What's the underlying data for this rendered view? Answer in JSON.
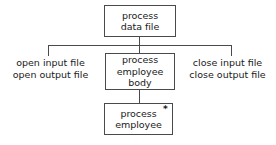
{
  "diagram": {
    "type": "structure-chart",
    "nodes": [
      {
        "id": "process-data-file",
        "lines": [
          "process",
          "data file"
        ],
        "level": 0
      },
      {
        "id": "process-employee-body",
        "lines": [
          "process",
          "employee",
          "body"
        ],
        "level": 1
      },
      {
        "id": "process-employee",
        "lines": [
          "process",
          "employee"
        ],
        "level": 2,
        "marker": "*"
      }
    ],
    "side_labels": {
      "left": {
        "line1": "open input file",
        "line2": "open output file"
      },
      "right": {
        "line1": "close input file",
        "line2": "close output file"
      }
    },
    "markers": {
      "iteration": "*"
    },
    "colors": {
      "background": "#ffffff",
      "border": "#4a4a4a",
      "text": "#1a1a1a",
      "connector": "#4a4a4a"
    }
  }
}
